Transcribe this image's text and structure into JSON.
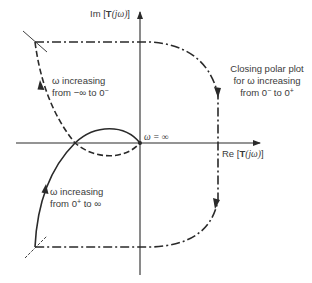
{
  "figure": {
    "type": "polar-plot-diagram",
    "axes": {
      "imag_label": {
        "prefix": "Im [",
        "bold": "T",
        "arg": "(jω)",
        "suffix": "]"
      },
      "real_label": {
        "prefix": "Re [",
        "bold": "T",
        "arg": "(jω)",
        "suffix": "]"
      }
    },
    "annotations": {
      "omega_infinity": "ω = ∞",
      "negative_branch": {
        "line1": "ω increasing",
        "line2_prefix": "from −∞ to 0",
        "line2_sup": "−"
      },
      "positive_branch": {
        "line1": "ω increasing",
        "line2_prefix": "from 0",
        "line2_sup": "+",
        "line2_suffix": " to ∞"
      },
      "closing": {
        "line1": "Closing polar plot",
        "line2": "for ω increasing",
        "line3_a": "from 0",
        "line3_sup_a": "−",
        "line3_b": " to 0",
        "line3_sup_b": "+"
      }
    },
    "curves": [
      {
        "name": "negative-frequency-branch",
        "style": "dashed",
        "description": "ω from −∞ to 0⁻"
      },
      {
        "name": "positive-frequency-branch",
        "style": "solid",
        "description": "ω from 0⁺ to ∞"
      },
      {
        "name": "closing-contour",
        "style": "dash-dot",
        "description": "ω from 0⁻ to 0⁺ at infinite radius"
      }
    ],
    "colors": {
      "ink": "#2a2a2a",
      "text": "#3a3a3a",
      "background": "#ffffff"
    }
  }
}
